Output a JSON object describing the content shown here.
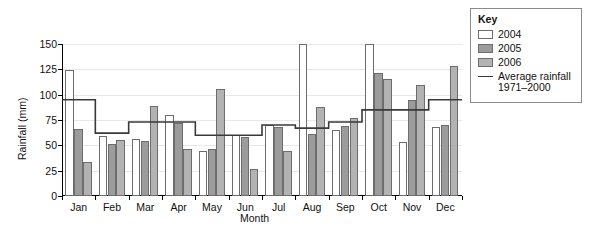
{
  "chart_data": {
    "type": "bar",
    "title": "",
    "xlabel": "Month",
    "ylabel": "Rainfall (mm)",
    "ylim": [
      0,
      150
    ],
    "yticks": [
      0,
      25,
      50,
      75,
      100,
      125,
      150
    ],
    "grid": true,
    "legend_position": "right-outside",
    "categories": [
      "Jan",
      "Feb",
      "Mar",
      "Apr",
      "May",
      "Jun",
      "Jul",
      "Aug",
      "Sep",
      "Oct",
      "Nov",
      "Dec"
    ],
    "series": [
      {
        "name": "2004",
        "color": "#ffffff",
        "values": [
          124,
          59,
          56,
          80,
          44,
          60,
          70,
          150,
          65,
          150,
          53,
          68
        ]
      },
      {
        "name": "2005",
        "color": "#9c9c9c",
        "values": [
          66,
          51,
          54,
          72,
          46,
          58,
          68,
          61,
          69,
          121,
          95,
          70
        ]
      },
      {
        "name": "2006",
        "color": "#b3b3b3",
        "values": [
          34,
          55,
          89,
          46,
          106,
          27,
          44,
          88,
          77,
          115,
          110,
          128
        ]
      },
      {
        "name": "Average rainfall 1971-2000",
        "type": "step-line",
        "color": "#3a3a3a",
        "values": [
          95,
          62,
          73,
          73,
          60,
          60,
          70,
          67,
          73,
          85,
          85,
          95
        ]
      }
    ]
  },
  "axes": {
    "y_title": "Rainfall (mm)",
    "x_title": "Month",
    "y_tick_labels": [
      "0",
      "25",
      "50",
      "75",
      "100",
      "125",
      "150"
    ],
    "x_tick_labels": [
      "Jan",
      "Feb",
      "Mar",
      "Apr",
      "May",
      "Jun",
      "Jul",
      "Aug",
      "Sep",
      "Oct",
      "Nov",
      "Dec"
    ]
  },
  "legend": {
    "title": "Key",
    "items": [
      {
        "label": "2004",
        "swatch": "y2004"
      },
      {
        "label": "2005",
        "swatch": "y2005"
      },
      {
        "label": "2006",
        "swatch": "y2006"
      }
    ],
    "line_item": {
      "label_line1": "Average rainfall",
      "label_line2": "1971–2000"
    }
  }
}
